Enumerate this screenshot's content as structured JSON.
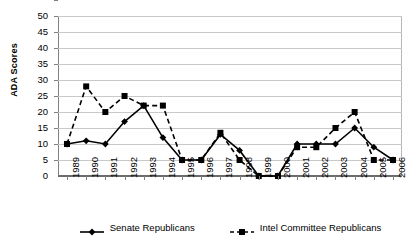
{
  "chart_data": {
    "type": "line",
    "title": "",
    "xlabel": "",
    "ylabel": "ADA Scores",
    "ylim": [
      0,
      50
    ],
    "ytick_step": 5,
    "yticks": [
      0,
      5,
      10,
      15,
      20,
      25,
      30,
      35,
      40,
      45,
      50
    ],
    "grid": true,
    "legend_position": "bottom",
    "categories": [
      "1989",
      "1990",
      "1991",
      "1992",
      "1993",
      "1994",
      "1995",
      "1996",
      "1997",
      "1998",
      "1999",
      "2000",
      "2001",
      "2002",
      "2003",
      "2004",
      "2005",
      "2006"
    ],
    "series": [
      {
        "name": "Senate Republicans",
        "marker": "diamond",
        "line_style": "solid",
        "color": "#000000",
        "values": [
          10,
          11,
          10,
          17,
          22,
          12,
          5,
          5,
          13,
          8,
          0,
          0,
          10,
          10,
          10,
          15,
          9,
          5
        ]
      },
      {
        "name": "Intel Committee Republicans",
        "marker": "square",
        "line_style": "dashed",
        "color": "#000000",
        "values": [
          10,
          28,
          20,
          25,
          22,
          22,
          5,
          5,
          13.5,
          5,
          0,
          0,
          9,
          9,
          15,
          20,
          5,
          5
        ]
      }
    ]
  },
  "axis": {
    "y_title": "ADA Scores"
  }
}
